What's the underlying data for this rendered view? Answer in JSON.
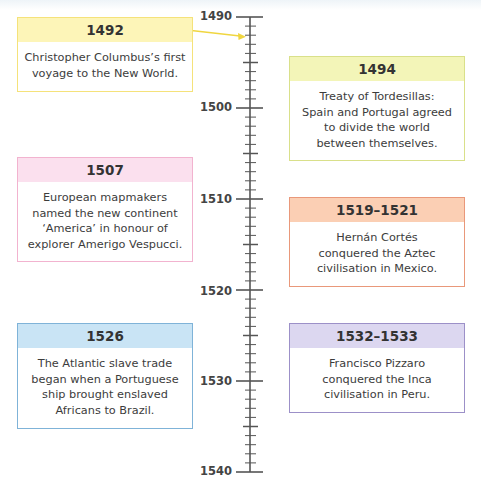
{
  "timeline": {
    "start_year": 1490,
    "end_year": 1540,
    "labels": [
      {
        "year": "1490",
        "y": 17
      },
      {
        "year": "1500",
        "y": 108
      },
      {
        "year": "1510",
        "y": 200
      },
      {
        "year": "1520",
        "y": 292
      },
      {
        "year": "1530",
        "y": 382
      },
      {
        "year": "1540",
        "y": 472
      }
    ],
    "axis_color": "#555555",
    "connector_color": "#f0d640"
  },
  "events": [
    {
      "id": "1492",
      "date": "1492",
      "text_lines": [
        "Christopher Columbus’s first",
        "voyage to the New World."
      ],
      "side": "left",
      "header_color": "#fdf5b8",
      "border_color": "#f5e27a"
    },
    {
      "id": "1494",
      "date": "1494",
      "text_lines": [
        "Treaty of Tordesillas:",
        "Spain and Portugal agreed",
        "to divide the world",
        "between themselves."
      ],
      "side": "right",
      "header_color": "#f3f5b8",
      "border_color": "#d9e08a"
    },
    {
      "id": "1507",
      "date": "1507",
      "text_lines": [
        "European mapmakers",
        "named the new continent",
        "‘America’ in honour of",
        "explorer Amerigo Vespucci."
      ],
      "side": "left",
      "header_color": "#fbe0ee",
      "border_color": "#f2b3cf"
    },
    {
      "id": "1519-1521",
      "date": "1519–1521",
      "text_lines": [
        "Hernán Cortés",
        "conquered the Aztec",
        "civilisation in Mexico."
      ],
      "side": "right",
      "header_color": "#fbcfb4",
      "border_color": "#e9987a"
    },
    {
      "id": "1526",
      "date": "1526",
      "text_lines": [
        "The Atlantic slave trade",
        "began when a Portuguese",
        "ship brought enslaved",
        "Africans to Brazil."
      ],
      "side": "left",
      "header_color": "#c9e4f5",
      "border_color": "#7fb3d8"
    },
    {
      "id": "1532-1533",
      "date": "1532–1533",
      "text_lines": [
        "Francisco Pizzaro",
        "conquered the Inca",
        "civilisation in Peru."
      ],
      "side": "right",
      "header_color": "#dcd7f0",
      "border_color": "#9c90c8"
    }
  ]
}
